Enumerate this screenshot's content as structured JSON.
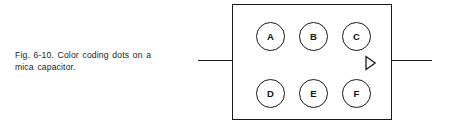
{
  "figure": {
    "caption_line_1": "Fig. 6-10. Color coding dots on a",
    "caption_line_2": "mica capacitor.",
    "colors": {
      "ink": "#1a1a1a",
      "background": "#ffffff",
      "label_text": "#111111"
    }
  },
  "capacitor": {
    "dots_row_top": [
      {
        "label": "A"
      },
      {
        "label": "B"
      },
      {
        "label": "C"
      }
    ],
    "dots_row_bottom": [
      {
        "label": "D"
      },
      {
        "label": "E"
      },
      {
        "label": "F"
      }
    ],
    "direction_marker": "right-triangle-icon",
    "left_lead": "lead-wire-left",
    "right_lead": "lead-wire-right"
  }
}
